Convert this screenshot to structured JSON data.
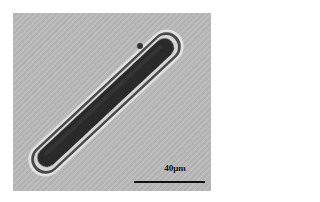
{
  "figure": {
    "background_color": "#b9b9b9",
    "scale_bar": {
      "label": "40μm",
      "color": "#111111"
    }
  }
}
